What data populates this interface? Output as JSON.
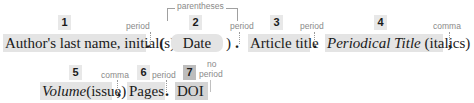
{
  "diagram": {
    "colors": {
      "box_fill": "#e4e4e4",
      "badge_fill": "#e8e8e8",
      "badge_dark_fill": "#bdbdbd",
      "label_text": "#8a8a8a",
      "main_text": "#1a1a1a"
    },
    "rows": [
      {
        "elements": [
          {
            "number": "1",
            "text": "Author's last name, initial(s)",
            "after_label": "period",
            "after_punct": "."
          },
          {
            "number": "2",
            "text": "Date",
            "wrapper": "parentheses",
            "open": "(",
            "close": ")",
            "after_label": "period",
            "after_punct": "."
          },
          {
            "number": "3",
            "text": "Article title",
            "after_label": "period",
            "after_punct": "."
          },
          {
            "number": "4",
            "text_italic": "Periodical Title",
            "text_rest": "(italics)",
            "after_label": "comma",
            "after_punct": ","
          }
        ]
      },
      {
        "elements": [
          {
            "number": "5",
            "text_italic": "Volume",
            "text_rest": "(issue)",
            "after_label": "comma",
            "after_punct": ","
          },
          {
            "number": "6",
            "text": "Pages",
            "after_label": "period",
            "after_punct": "."
          },
          {
            "number": "7",
            "text": "DOI",
            "after_label": "no period",
            "after_label_line1": "no",
            "after_label_line2": "period",
            "emphasis": "dark"
          }
        ]
      }
    ],
    "wrapper_label": "parentheses"
  }
}
